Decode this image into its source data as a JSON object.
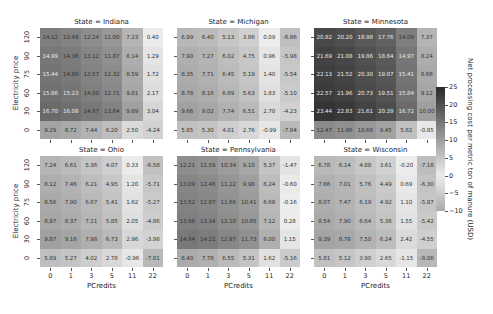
{
  "chart_data": {
    "type": "heatmap",
    "layout": "facet grid 2 rows x 3 columns",
    "facet_variable": "State",
    "xlabel": "PCredits",
    "ylabel": "Electricity price",
    "x_categories": [
      "0",
      "1",
      "3",
      "5",
      "11",
      "22"
    ],
    "y_categories": [
      "120",
      "90",
      "75",
      "60",
      "30",
      "0"
    ],
    "colorbar": {
      "label": "Net processing cost per metric ton of manure (USD)",
      "min": -10,
      "max": 25,
      "ticks": [
        "25",
        "20",
        "15",
        "10",
        "5",
        "0",
        "−5",
        "−10"
      ],
      "colormap": "grayscale (light = low, dark = high)"
    },
    "panels": [
      {
        "title": "State = Indiana",
        "values": [
          [
            14.12,
            13.49,
            12.24,
            11.0,
            7.23,
            0.4
          ],
          [
            14.99,
            14.36,
            13.12,
            11.87,
            8.14,
            1.29
          ],
          [
            15.44,
            14.8,
            13.57,
            12.32,
            8.59,
            1.72
          ],
          [
            15.86,
            15.23,
            14.0,
            12.71,
            9.01,
            2.17
          ],
          [
            16.7,
            16.08,
            14.87,
            13.64,
            9.89,
            3.04
          ],
          [
            9.29,
            8.72,
            7.44,
            6.2,
            2.5,
            -4.24
          ]
        ]
      },
      {
        "title": "State = Michigan",
        "values": [
          [
            6.99,
            6.4,
            5.13,
            3.86,
            0.09,
            -6.86
          ],
          [
            7.9,
            7.27,
            6.02,
            4.75,
            0.96,
            -5.98
          ],
          [
            8.35,
            7.71,
            6.45,
            5.19,
            1.4,
            -5.54
          ],
          [
            8.78,
            8.16,
            6.89,
            5.63,
            1.83,
            -5.1
          ],
          [
            9.66,
            9.02,
            7.74,
            6.51,
            2.7,
            -4.23
          ],
          [
            5.85,
            5.3,
            4.01,
            2.76,
            -0.99,
            -7.84
          ]
        ]
      },
      {
        "title": "State = Minnesota",
        "values": [
          [
            20.82,
            20.2,
            18.98,
            17.76,
            14.09,
            7.37
          ],
          [
            21.69,
            21.08,
            19.86,
            18.64,
            14.97,
            8.24
          ],
          [
            22.13,
            21.52,
            20.3,
            19.07,
            15.41,
            8.68
          ],
          [
            22.57,
            21.96,
            20.73,
            19.51,
            15.84,
            9.12
          ],
          [
            23.44,
            22.83,
            21.61,
            20.39,
            16.72,
            10.0
          ],
          [
            12.47,
            11.86,
            10.68,
            9.45,
            5.82,
            -0.85
          ]
        ]
      },
      {
        "title": "State = Ohio",
        "values": [
          [
            7.24,
            6.61,
            5.36,
            4.07,
            0.33,
            -6.58
          ],
          [
            8.12,
            7.46,
            6.21,
            4.95,
            1.2,
            -5.71
          ],
          [
            8.56,
            7.9,
            6.67,
            5.41,
            1.62,
            -5.27
          ],
          [
            8.97,
            8.37,
            7.11,
            5.85,
            2.05,
            -4.86
          ],
          [
            9.87,
            9.16,
            7.98,
            6.73,
            2.96,
            -3.98
          ],
          [
            5.89,
            5.27,
            4.02,
            2.78,
            -0.96,
            -7.81
          ]
        ]
      },
      {
        "title": "State = Pennsylvania",
        "values": [
          [
            12.21,
            11.59,
            10.34,
            9.1,
            5.37,
            -1.47
          ],
          [
            13.09,
            12.46,
            11.22,
            9.98,
            6.24,
            -0.6
          ],
          [
            13.52,
            12.87,
            11.66,
            10.41,
            6.68,
            -0.16
          ],
          [
            13.96,
            13.34,
            12.1,
            10.85,
            7.12,
            0.28
          ],
          [
            14.84,
            14.22,
            12.97,
            11.73,
            8.0,
            1.15
          ],
          [
            8.4,
            7.78,
            6.55,
            5.31,
            1.62,
            -5.16
          ]
        ]
      },
      {
        "title": "State = Wisconsin",
        "values": [
          [
            6.78,
            6.14,
            4.88,
            3.61,
            -0.2,
            -7.18
          ],
          [
            7.66,
            7.01,
            5.76,
            4.49,
            0.69,
            -6.3
          ],
          [
            8.07,
            7.47,
            6.19,
            4.92,
            1.1,
            -5.87
          ],
          [
            8.54,
            7.9,
            6.64,
            5.36,
            1.55,
            -5.42
          ],
          [
            9.39,
            8.78,
            7.5,
            6.24,
            2.42,
            -4.55
          ],
          [
            5.81,
            5.12,
            3.9,
            2.65,
            -1.15,
            -8.06
          ]
        ]
      }
    ]
  }
}
